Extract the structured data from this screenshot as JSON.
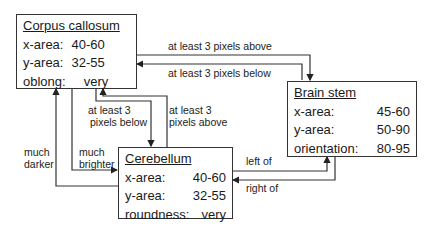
{
  "nodes": {
    "corpus_callosum": {
      "title": "Corpus callosum",
      "rows": [
        {
          "key": "x-area:",
          "value": "40-60"
        },
        {
          "key": "y-area:",
          "value": "32-55"
        },
        {
          "key": "oblong:",
          "value": "very"
        }
      ]
    },
    "brain_stem": {
      "title": "Brain stem",
      "rows": [
        {
          "key": "x-area:",
          "value": "45-60"
        },
        {
          "key": "y-area:",
          "value": "50-90"
        },
        {
          "key": "orientation:",
          "value": "80-95"
        }
      ]
    },
    "cerebellum": {
      "title": "Cerebellum",
      "rows": [
        {
          "key": "x-area:",
          "value": "40-60"
        },
        {
          "key": "y-area:",
          "value": "32-55"
        },
        {
          "key": "roundness:",
          "value": "very"
        }
      ]
    }
  },
  "edges": {
    "cc_to_bs": "at least 3 pixels above",
    "bs_to_cc": "at least 3 pixels below",
    "cc_to_cb_below_1": "at least 3",
    "cc_to_cb_below_2": "pixels below",
    "cb_to_cc_above_1": "at least 3",
    "cb_to_cc_above_2": "pixels above",
    "much_darker_1": "much",
    "much_darker_2": "darker",
    "much_brighter_1": "much",
    "much_brighter_2": "brighter",
    "left_of": "left of",
    "right_of": "right of"
  }
}
